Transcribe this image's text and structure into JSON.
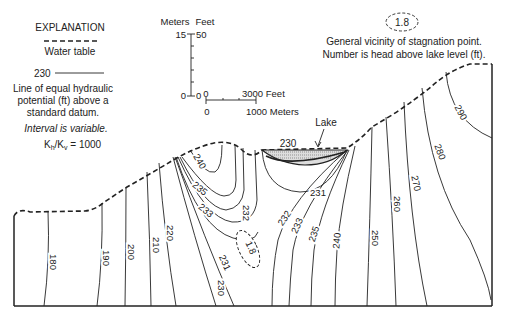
{
  "explanation": {
    "title": "EXPLANATION",
    "water_table_label": "Water table",
    "contour_sample_value": "230",
    "contour_desc_1": "Line of equal hydraulic",
    "contour_desc_2": "potential (ft) above a",
    "contour_desc_3": "standard datum.",
    "interval_note": "Interval is variable.",
    "ratio_label": "K",
    "ratio_h": "h",
    "ratio_sep": "/K",
    "ratio_v": "v",
    "ratio_value": " = 1000"
  },
  "vertical_scale": {
    "left_unit": "Meters",
    "right_unit": "Feet",
    "left_top": "15",
    "right_top": "50",
    "left_bottom": "0",
    "right_bottom": "0"
  },
  "horizontal_scale": {
    "top_start": "0",
    "top_end": "3000 Feet",
    "bottom_start": "0",
    "bottom_end": "1000 Meters"
  },
  "stagnation_legend": {
    "value": "1.8",
    "desc_1": "General vicinity of stagnation point.",
    "desc_2": "Number is head above lake level (ft)."
  },
  "lake": {
    "label": "Lake",
    "level": "230"
  },
  "contours": {
    "c180": "180",
    "c190": "190",
    "c200": "200",
    "c210": "210",
    "c220": "220",
    "c230": "230",
    "c231a": "231",
    "c231b": "231",
    "c232a": "232",
    "c232b": "232",
    "c233a": "233",
    "c233b": "233",
    "c235a": "235",
    "c235b": "235",
    "c240a": "240",
    "c240b": "240",
    "c250": "250",
    "c260": "260",
    "c270": "270",
    "c280": "280",
    "c290": "290"
  },
  "stagnation_point": {
    "value": "1.8"
  }
}
